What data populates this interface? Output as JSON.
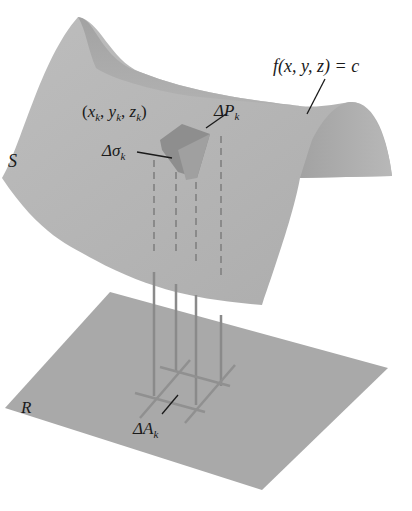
{
  "diagram": {
    "type": "surface-integral-illustration",
    "colors": {
      "background": "#ffffff",
      "surface": "#b4b4b4",
      "surface_shadow": "#9e9e9e",
      "patch": "#8c8c8c",
      "plane": "#a6a6a6",
      "projection_lines": "#8a8a8a",
      "leader": "#1a1a1a"
    },
    "labels": {
      "surface": "S",
      "equation": "f(x, y, z) = c",
      "point": "(x_k, y_k, z_k)",
      "point_x": "x",
      "point_y": "y",
      "point_z": "z",
      "point_sub": "k",
      "delta_p": "ΔP",
      "delta_p_sub": "k",
      "delta_sigma": "Δσ",
      "delta_sigma_sub": "k",
      "region": "R",
      "delta_a": "ΔA",
      "delta_a_sub": "k"
    }
  }
}
